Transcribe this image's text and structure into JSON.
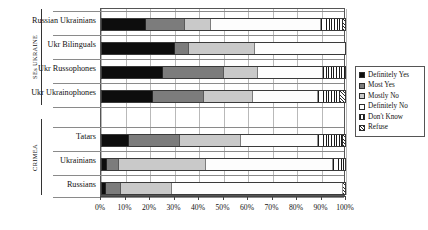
{
  "chart_data": {
    "type": "bar",
    "subtype": "stacked-horizontal-100percent",
    "title": "",
    "xlabel": "",
    "ylabel": "",
    "xlim": [
      0,
      100
    ],
    "xticks": [
      "0%",
      "10%",
      "20%",
      "30%",
      "40%",
      "50%",
      "60%",
      "70%",
      "80%",
      "90%",
      "100%"
    ],
    "grid": true,
    "legend_position": "right",
    "legend": [
      "Definitely Yes",
      "Most Yes",
      "Mostly No",
      "Definitely No",
      "Don't Know",
      "Refuse"
    ],
    "groups": [
      {
        "name": "SEs UKRAINE",
        "categories": [
          "Russian Ukrainians",
          "Ukr Bilinguals",
          "Ukr Russophones",
          "Ukr Ukrainophones"
        ]
      },
      {
        "name": "CRIMEA",
        "categories": [
          "Tatars",
          "Ukrainians",
          "Russians"
        ]
      }
    ],
    "categories": [
      "Russian Ukrainians",
      "Ukr Bilinguals",
      "Ukr Russophones",
      "Ukr Ukrainophones",
      "Tatars",
      "Ukrainians",
      "Russians"
    ],
    "series": [
      {
        "name": "Definitely Yes",
        "values": [
          18.0,
          30.0,
          25.0,
          21.0,
          11.0,
          2.0,
          1.5
        ]
      },
      {
        "name": "Most Yes",
        "values": [
          16.0,
          6.0,
          25.0,
          21.0,
          21.0,
          5.0,
          6.5
        ]
      },
      {
        "name": "Mostly No",
        "values": [
          11.0,
          27.0,
          14.0,
          20.0,
          25.0,
          36.0,
          21.0
        ]
      },
      {
        "name": "Definitely No",
        "values": [
          45.0,
          37.0,
          27.0,
          27.0,
          32.0,
          52.0,
          70.0
        ]
      },
      {
        "name": "Don't Know",
        "values": [
          9.0,
          0.0,
          9.0,
          9.0,
          10.0,
          5.0,
          0.0
        ]
      },
      {
        "name": "Refuse",
        "values": [
          1.0,
          0.0,
          0.0,
          2.0,
          1.0,
          0.0,
          1.0
        ]
      }
    ]
  }
}
